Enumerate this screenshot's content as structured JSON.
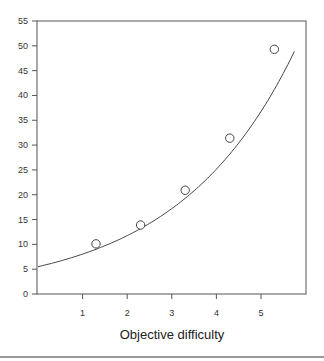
{
  "chart_data": {
    "type": "scatter",
    "title": "",
    "xlabel": "Objective difficulty",
    "ylabel": "",
    "xlim": [
      0,
      6
    ],
    "ylim": [
      0,
      55
    ],
    "grid": false,
    "legend": null,
    "x_ticks": [
      1,
      2,
      3,
      4,
      5
    ],
    "y_ticks": [
      0,
      5,
      10,
      15,
      20,
      25,
      30,
      35,
      40,
      45,
      50,
      55
    ],
    "series": [
      {
        "name": "observed",
        "marker": "open-circle",
        "x": [
          1.3,
          2.3,
          3.3,
          4.3,
          5.3
        ],
        "y": [
          10.1,
          13.9,
          20.9,
          31.4,
          49.3
        ]
      },
      {
        "name": "fitted-curve",
        "style": "line",
        "x": [
          0,
          1,
          2,
          3,
          4,
          5,
          5.8
        ],
        "y": [
          5.5,
          8.0,
          12.0,
          18.5,
          27.5,
          41.5,
          55
        ]
      }
    ]
  }
}
